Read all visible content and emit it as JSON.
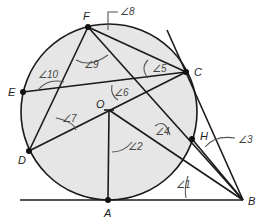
{
  "diagram": {
    "circle": {
      "center": "O",
      "cx": 109,
      "cy": 112,
      "r": 88,
      "fill": "#e6e6e6",
      "stroke": "#1a1a1a"
    },
    "points": [
      {
        "name": "F",
        "x": 88,
        "y": 27,
        "label": "F",
        "lx": 83,
        "ly": 20
      },
      {
        "name": "C",
        "x": 186,
        "y": 72,
        "label": "C",
        "lx": 194,
        "ly": 76
      },
      {
        "name": "E",
        "x": 23,
        "y": 92,
        "label": "E",
        "lx": 8,
        "ly": 96
      },
      {
        "name": "D",
        "x": 29,
        "y": 151,
        "label": "D",
        "lx": 18,
        "ly": 164
      },
      {
        "name": "O",
        "x": 109,
        "y": 110,
        "label": "O",
        "lx": 96,
        "ly": 108
      },
      {
        "name": "H",
        "x": 192,
        "y": 139,
        "label": "H",
        "lx": 200,
        "ly": 140
      },
      {
        "name": "A",
        "x": 108,
        "y": 200,
        "label": "A",
        "lx": 104,
        "ly": 217
      },
      {
        "name": "B",
        "x": 243,
        "y": 200,
        "label": "B",
        "lx": 248,
        "ly": 205
      }
    ],
    "angles": [
      {
        "label": "∠1",
        "x": 182,
        "y": 186
      },
      {
        "label": "∠2",
        "x": 132,
        "y": 146
      },
      {
        "label": "∠3",
        "x": 238,
        "y": 141
      },
      {
        "label": "∠4",
        "x": 151,
        "y": 134
      },
      {
        "label": "∠5",
        "x": 155,
        "y": 67
      },
      {
        "label": "∠6",
        "x": 114,
        "y": 96
      },
      {
        "label": "∠7",
        "x": 62,
        "y": 120
      },
      {
        "label": "∠8",
        "x": 123,
        "y": 15
      },
      {
        "label": "∠9",
        "x": 92,
        "y": 63
      },
      {
        "label": "∠10",
        "x": 36,
        "y": 84
      }
    ]
  }
}
